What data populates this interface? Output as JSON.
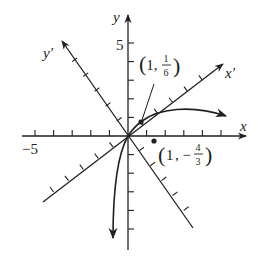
{
  "figure": {
    "type": "rotation-of-axes-diagram",
    "axes": {
      "x_label": "x",
      "y_label": "y",
      "x_prime_label": "x′",
      "y_prime_label": "y′",
      "x_tick_label": "−5",
      "y_tick_label": "5"
    },
    "points": [
      {
        "label_open": "(1, ",
        "num": "1",
        "den": "6",
        "label_close": ")",
        "x": 1,
        "y": "1/6"
      },
      {
        "label_open": "(1, −",
        "num": "4",
        "den": "3",
        "label_close": ")",
        "x": 1,
        "y": "-4/3"
      }
    ],
    "colors": {
      "ink": "#231f20",
      "background": "#ffffff"
    }
  }
}
